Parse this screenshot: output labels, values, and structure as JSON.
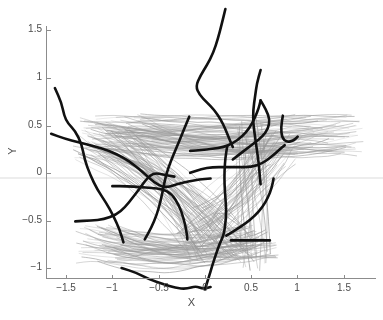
{
  "figure": {
    "width": 383,
    "height": 320,
    "background": "#ffffff"
  },
  "axes": {
    "x_title": "X",
    "y_title": "Y",
    "x_ticks": [
      {
        "value": -1.5,
        "label": "−1.5",
        "px": 66
      },
      {
        "value": -1,
        "label": "−1",
        "px": 112
      },
      {
        "value": -0.5,
        "label": "−0.5",
        "px": 159
      },
      {
        "value": 0,
        "label": "0",
        "px": 205
      },
      {
        "value": 0.5,
        "label": "0.5",
        "px": 251
      },
      {
        "value": 1,
        "label": "1",
        "px": 297
      },
      {
        "value": 1.5,
        "label": "1.5",
        "px": 344
      }
    ],
    "y_ticks": [
      {
        "value": 1.5,
        "label": "1.5",
        "px": 30
      },
      {
        "value": 1,
        "label": "1",
        "px": 78
      },
      {
        "value": 0.5,
        "label": "0.5",
        "px": 126
      },
      {
        "value": 0,
        "label": "0",
        "px": 173
      },
      {
        "value": -0.5,
        "label": "−0.5",
        "px": 221
      },
      {
        "value": -1,
        "label": "−1",
        "px": 268
      }
    ],
    "spine_color": "#8c8c8c",
    "tick_label_color": "#4d4d4d"
  },
  "chart_data": {
    "type": "line",
    "title": "",
    "xlabel": "X",
    "ylabel": "Y",
    "xlim": [
      -1.79,
      1.86
    ],
    "ylim": [
      -1.23,
      1.72
    ],
    "grid": false,
    "legend": "none",
    "series": [
      {
        "name": "background-trajectory-bundle",
        "color": "#9a9a9a",
        "linewidth": 0.6,
        "count": 260,
        "style": "light-gray bundle",
        "bundle_model": {
          "groups": [
            {
              "name": "upper-right-fan",
              "weight": 0.3,
              "start_x": [
                -1.35,
                -0.55
              ],
              "start_y": [
                0.25,
                0.62
              ],
              "end_x": [
                0.75,
                1.72
              ],
              "end_y": [
                0.18,
                0.62
              ],
              "sag": -0.05
            },
            {
              "name": "lower-left-descending",
              "weight": 0.26,
              "start_x": [
                -1.45,
                -0.7
              ],
              "start_y": [
                0.1,
                0.5
              ],
              "end_x": [
                -0.2,
                0.55
              ],
              "end_y": [
                -0.95,
                -0.55
              ],
              "sag": 0.12
            },
            {
              "name": "lower-basin-sweep",
              "weight": 0.24,
              "start_x": [
                -1.4,
                -0.85
              ],
              "start_y": [
                -0.95,
                -0.55
              ],
              "end_x": [
                0.3,
                0.8
              ],
              "end_y": [
                -0.9,
                -0.55
              ],
              "sag": -0.1
            },
            {
              "name": "center-rising-to-right",
              "weight": 0.14,
              "start_x": [
                -0.35,
                0.25
              ],
              "start_y": [
                -0.85,
                -0.35
              ],
              "end_x": [
                0.55,
                1.1
              ],
              "end_y": [
                0.05,
                0.45
              ],
              "sag": -0.08
            },
            {
              "name": "right-vertical-drop",
              "weight": 0.06,
              "start_x": [
                0.35,
                0.7
              ],
              "start_y": [
                0.3,
                0.58
              ],
              "end_x": [
                0.3,
                0.72
              ],
              "end_y": [
                -1.05,
                -0.7
              ],
              "sag": 0.04
            }
          ]
        }
      },
      {
        "name": "highlighted-trajectory-1",
        "color": "#111111",
        "linewidth": 2.6,
        "points": [
          [
            -1.62,
            0.89
          ],
          [
            -1.55,
            0.74
          ],
          [
            -1.52,
            0.6
          ],
          [
            -1.48,
            0.52
          ],
          [
            -1.4,
            0.44
          ],
          [
            -1.33,
            0.3
          ],
          [
            -1.3,
            0.14
          ],
          [
            -1.24,
            -0.02
          ],
          [
            -1.16,
            -0.18
          ],
          [
            -1.07,
            -0.31
          ],
          [
            -0.99,
            -0.45
          ],
          [
            -0.92,
            -0.6
          ],
          [
            -0.88,
            -0.73
          ]
        ]
      },
      {
        "name": "highlighted-trajectory-2",
        "color": "#111111",
        "linewidth": 2.6,
        "points": [
          [
            -1.66,
            0.41
          ],
          [
            -1.52,
            0.36
          ],
          [
            -1.36,
            0.32
          ],
          [
            -1.2,
            0.28
          ],
          [
            -1.03,
            0.23
          ],
          [
            -0.88,
            0.16
          ],
          [
            -0.76,
            0.08
          ],
          [
            -0.64,
            -0.02
          ],
          [
            -0.55,
            -0.1
          ],
          [
            -0.44,
            -0.16
          ],
          [
            -0.3,
            -0.12
          ],
          [
            -0.18,
            -0.09
          ],
          [
            -0.06,
            -0.07
          ],
          [
            0.06,
            -0.06
          ]
        ]
      },
      {
        "name": "highlighted-trajectory-3",
        "color": "#111111",
        "linewidth": 2.6,
        "points": [
          [
            -1.4,
            -0.51
          ],
          [
            -1.23,
            -0.5
          ],
          [
            -1.09,
            -0.49
          ],
          [
            -0.96,
            -0.44
          ],
          [
            -0.86,
            -0.36
          ],
          [
            -0.78,
            -0.26
          ],
          [
            -0.7,
            -0.16
          ],
          [
            -0.63,
            -0.06
          ],
          [
            -0.55,
            0.0
          ],
          [
            -0.44,
            -0.02
          ],
          [
            -0.33,
            -0.04
          ]
        ]
      },
      {
        "name": "highlighted-trajectory-4",
        "color": "#111111",
        "linewidth": 2.6,
        "points": [
          [
            -1.0,
            -0.14
          ],
          [
            -0.84,
            -0.14
          ],
          [
            -0.7,
            -0.15
          ],
          [
            -0.58,
            -0.16
          ],
          [
            -0.46,
            -0.17
          ],
          [
            -0.36,
            -0.22
          ],
          [
            -0.28,
            -0.34
          ],
          [
            -0.23,
            -0.48
          ],
          [
            -0.2,
            -0.61
          ],
          [
            -0.19,
            -0.7
          ]
        ]
      },
      {
        "name": "highlighted-trajectory-5",
        "color": "#111111",
        "linewidth": 2.6,
        "points": [
          [
            -0.65,
            -0.7
          ],
          [
            -0.58,
            -0.58
          ],
          [
            -0.52,
            -0.44
          ],
          [
            -0.48,
            -0.3
          ],
          [
            -0.45,
            -0.16
          ],
          [
            -0.42,
            -0.02
          ],
          [
            -0.37,
            0.12
          ],
          [
            -0.31,
            0.26
          ],
          [
            -0.25,
            0.4
          ],
          [
            -0.2,
            0.52
          ],
          [
            -0.17,
            0.59
          ]
        ]
      },
      {
        "name": "highlighted-trajectory-6",
        "color": "#111111",
        "linewidth": 2.6,
        "points": [
          [
            -0.9,
            -1.0
          ],
          [
            -0.74,
            -1.05
          ],
          [
            -0.6,
            -1.12
          ],
          [
            -0.45,
            -1.17
          ],
          [
            -0.32,
            -1.21
          ],
          [
            -0.2,
            -1.22
          ],
          [
            -0.1,
            -1.19
          ],
          [
            -0.02,
            -1.22
          ],
          [
            0.06,
            -1.2
          ]
        ]
      },
      {
        "name": "highlighted-trajectory-7",
        "color": "#111111",
        "linewidth": 2.6,
        "points": [
          [
            0.0,
            -1.22
          ],
          [
            0.04,
            -1.1
          ],
          [
            0.08,
            -0.97
          ],
          [
            0.12,
            -0.85
          ],
          [
            0.16,
            -0.74
          ],
          [
            0.2,
            -0.66
          ],
          [
            0.22,
            -0.54
          ],
          [
            0.23,
            -0.4
          ],
          [
            0.22,
            -0.26
          ],
          [
            0.21,
            -0.12
          ],
          [
            0.21,
            0.02
          ],
          [
            0.22,
            0.16
          ],
          [
            0.24,
            0.28
          ]
        ]
      },
      {
        "name": "highlighted-trajectory-8",
        "color": "#111111",
        "linewidth": 2.6,
        "points": [
          [
            -0.16,
            0.23
          ],
          [
            -0.04,
            0.24
          ],
          [
            0.08,
            0.25
          ],
          [
            0.2,
            0.27
          ],
          [
            0.3,
            0.31
          ],
          [
            0.4,
            0.38
          ],
          [
            0.48,
            0.47
          ],
          [
            0.54,
            0.58
          ],
          [
            0.58,
            0.68
          ],
          [
            0.6,
            0.76
          ]
        ]
      },
      {
        "name": "highlighted-trajectory-9",
        "color": "#111111",
        "linewidth": 2.6,
        "points": [
          [
            0.22,
            1.72
          ],
          [
            0.18,
            1.56
          ],
          [
            0.14,
            1.41
          ],
          [
            0.09,
            1.26
          ],
          [
            0.02,
            1.13
          ],
          [
            -0.05,
            1.02
          ],
          [
            -0.1,
            0.91
          ],
          [
            -0.06,
            0.82
          ],
          [
            0.02,
            0.74
          ],
          [
            0.1,
            0.66
          ],
          [
            0.17,
            0.56
          ],
          [
            0.22,
            0.46
          ],
          [
            0.26,
            0.36
          ],
          [
            0.3,
            0.27
          ]
        ]
      },
      {
        "name": "highlighted-trajectory-10",
        "color": "#111111",
        "linewidth": 2.6,
        "points": [
          [
            0.6,
            1.08
          ],
          [
            0.56,
            0.94
          ],
          [
            0.54,
            0.8
          ],
          [
            0.52,
            0.66
          ],
          [
            0.52,
            0.52
          ],
          [
            0.54,
            0.38
          ],
          [
            0.56,
            0.24
          ],
          [
            0.58,
            0.1
          ],
          [
            0.59,
            -0.02
          ],
          [
            0.6,
            -0.12
          ]
        ]
      },
      {
        "name": "highlighted-trajectory-11",
        "color": "#111111",
        "linewidth": 2.6,
        "points": [
          [
            0.84,
            0.6
          ],
          [
            0.82,
            0.48
          ],
          [
            0.83,
            0.37
          ],
          [
            0.88,
            0.32
          ],
          [
            0.96,
            0.34
          ],
          [
            1.0,
            0.38
          ]
        ]
      },
      {
        "name": "highlighted-trajectory-12",
        "color": "#111111",
        "linewidth": 2.6,
        "points": [
          [
            -0.16,
            0.0
          ],
          [
            -0.04,
            0.04
          ],
          [
            0.08,
            0.06
          ],
          [
            0.22,
            0.06
          ],
          [
            0.36,
            0.06
          ],
          [
            0.5,
            0.06
          ],
          [
            0.62,
            0.1
          ],
          [
            0.72,
            0.17
          ],
          [
            0.8,
            0.24
          ],
          [
            0.86,
            0.29
          ]
        ]
      },
      {
        "name": "highlighted-trajectory-13",
        "color": "#111111",
        "linewidth": 2.6,
        "points": [
          [
            0.23,
            -0.66
          ],
          [
            0.33,
            -0.6
          ],
          [
            0.44,
            -0.53
          ],
          [
            0.54,
            -0.45
          ],
          [
            0.62,
            -0.36
          ],
          [
            0.68,
            -0.26
          ],
          [
            0.72,
            -0.16
          ],
          [
            0.74,
            -0.06
          ]
        ]
      },
      {
        "name": "highlighted-trajectory-14",
        "color": "#111111",
        "linewidth": 2.6,
        "points": [
          [
            0.28,
            -0.71
          ],
          [
            0.4,
            -0.71
          ],
          [
            0.52,
            -0.71
          ],
          [
            0.62,
            -0.71
          ],
          [
            0.7,
            -0.71
          ]
        ]
      },
      {
        "name": "highlighted-trajectory-15",
        "color": "#111111",
        "linewidth": 2.6,
        "points": [
          [
            0.6,
            0.76
          ],
          [
            0.66,
            0.66
          ],
          [
            0.7,
            0.56
          ],
          [
            0.68,
            0.46
          ],
          [
            0.62,
            0.38
          ],
          [
            0.54,
            0.32
          ],
          [
            0.46,
            0.26
          ],
          [
            0.38,
            0.2
          ],
          [
            0.3,
            0.14
          ]
        ]
      }
    ]
  },
  "highlight_band": {
    "name": "horizontal-highlight-band",
    "color": "#ededed",
    "y_value": -0.08
  }
}
